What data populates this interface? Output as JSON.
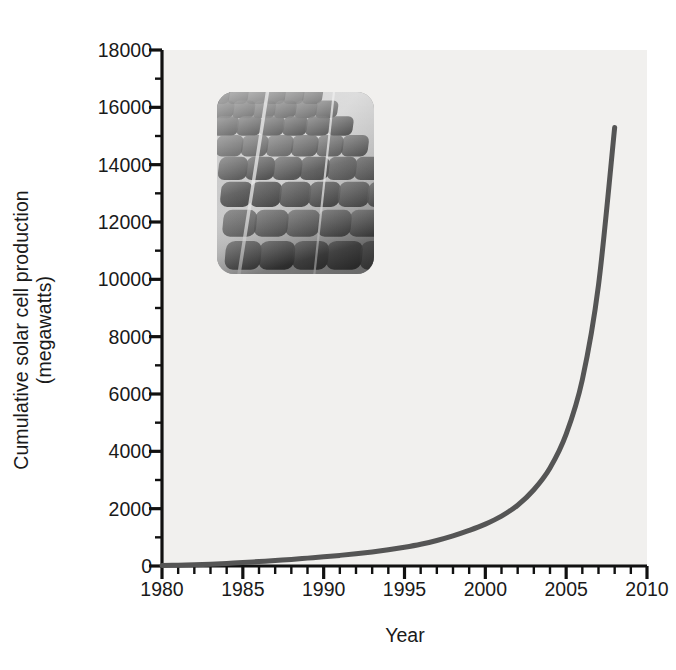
{
  "chart_data": {
    "type": "line",
    "title": "",
    "xlabel": "Year",
    "ylabel": "Cumulative solar cell production (megawatts)",
    "ylabel_line1": "Cumulative solar cell production",
    "ylabel_line2": "(megawatts)",
    "xlim": [
      1980,
      2010
    ],
    "ylim": [
      0,
      18000
    ],
    "x_major_ticks": [
      1980,
      1985,
      1990,
      1995,
      2000,
      2005,
      2010
    ],
    "x_major_tick_labels": [
      "1980",
      "1985",
      "1990",
      "1995",
      "2000",
      "2005",
      "2010"
    ],
    "x_minor_tick_step": 1,
    "y_major_ticks": [
      0,
      2000,
      4000,
      6000,
      8000,
      10000,
      12000,
      14000,
      16000,
      18000
    ],
    "y_major_tick_labels": [
      "0",
      "2000",
      "4000",
      "6000",
      "8000",
      "10000",
      "12000",
      "14000",
      "16000",
      "18000"
    ],
    "y_minor_tick_step": 1000,
    "grid": false,
    "legend": null,
    "series": [
      {
        "name": "Cumulative solar cell production",
        "x": [
          1980,
          1981,
          1982,
          1983,
          1984,
          1985,
          1986,
          1987,
          1988,
          1989,
          1990,
          1991,
          1992,
          1993,
          1994,
          1995,
          1996,
          1997,
          1998,
          1999,
          2000,
          2001,
          2002,
          2003,
          2004,
          2005,
          2006,
          2007,
          2008
        ],
        "values": [
          20,
          30,
          45,
          65,
          90,
          120,
          155,
          190,
          230,
          275,
          320,
          370,
          425,
          490,
          565,
          655,
          760,
          890,
          1050,
          1240,
          1460,
          1740,
          2120,
          2660,
          3420,
          4600,
          6500,
          9800,
          15300
        ]
      }
    ],
    "line_color": "#555555",
    "line_width_px": 5,
    "plot_background": "#f1f0ee",
    "figure_background": "#ffffff",
    "axis_color": "#111111",
    "final_value": 15300,
    "final_year": 2008
  },
  "inset": {
    "name": "solar-panel-photograph",
    "description": "Close-up grayscale photograph of a solar panel showing a grid of rounded-square photovoltaic cells",
    "corner_radius_px": 17
  }
}
